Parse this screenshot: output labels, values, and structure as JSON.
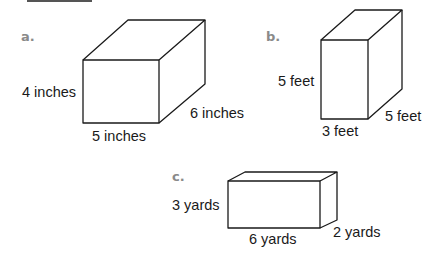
{
  "figure": {
    "header_bar": "",
    "prisms": [
      {
        "id": "a",
        "label": "a.",
        "height_label": "4 inches",
        "width_label": "5 inches",
        "depth_label": "6 inches"
      },
      {
        "id": "b",
        "label": "b.",
        "height_label": "5 feet",
        "width_label": "3 feet",
        "depth_label": "5 feet"
      },
      {
        "id": "c",
        "label": "c.",
        "height_label": "3 yards",
        "width_label": "6 yards",
        "depth_label": "2 yards"
      }
    ]
  }
}
